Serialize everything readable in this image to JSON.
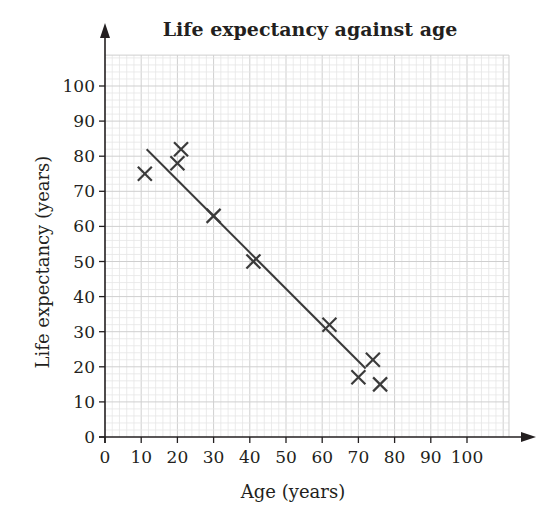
{
  "chart_data": {
    "type": "scatter",
    "title": "Life expectancy against age",
    "xlabel": "Age (years)",
    "ylabel": "Life expectancy (years)",
    "xlim": [
      0,
      100
    ],
    "ylim": [
      0,
      100
    ],
    "x_ticks": [
      0,
      10,
      20,
      30,
      40,
      50,
      60,
      70,
      80,
      90,
      100
    ],
    "y_ticks": [
      0,
      10,
      20,
      30,
      40,
      50,
      60,
      70,
      80,
      90,
      100
    ],
    "grid": true,
    "grid_minor_step": 2,
    "marker": "x",
    "points": [
      {
        "x": 11,
        "y": 75
      },
      {
        "x": 20,
        "y": 78
      },
      {
        "x": 21,
        "y": 82
      },
      {
        "x": 30,
        "y": 63
      },
      {
        "x": 41,
        "y": 50
      },
      {
        "x": 62,
        "y": 32
      },
      {
        "x": 70,
        "y": 17
      },
      {
        "x": 74,
        "y": 22
      },
      {
        "x": 76,
        "y": 15
      }
    ],
    "line_of_best_fit": {
      "start": {
        "x": 11.5,
        "y": 82
      },
      "end": {
        "x": 72,
        "y": 19.5
      }
    },
    "legend": null
  },
  "colors": {
    "ink": "#231f20",
    "grid_major": "#cfcfcf",
    "grid_minor": "#e6e6e6",
    "marker": "#3a3a3a",
    "fit_line": "#3a3a3a"
  }
}
